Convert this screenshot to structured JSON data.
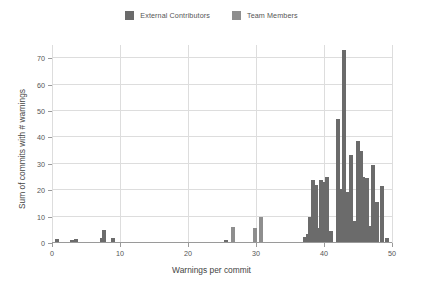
{
  "chart_data": {
    "type": "bar",
    "title": "",
    "xlabel": "Warnings per commit",
    "ylabel": "Sum of commits with # warnings",
    "xlim": [
      0,
      50
    ],
    "ylim": [
      0,
      75
    ],
    "yticks": [
      0,
      10,
      20,
      30,
      40,
      50,
      60,
      70
    ],
    "xticks": [
      0,
      10,
      20,
      30,
      40,
      50
    ],
    "grid": true,
    "legend_position": "top-center",
    "colors": {
      "external_contributors": "#6b6b6b",
      "team_members": "#8e8e8e",
      "gridline": "#dddddd",
      "axis": "#9a9a9a",
      "text": "#555555",
      "background": "#ffffff"
    },
    "series": [
      {
        "name": "External Contributors",
        "color": "#6b6b6b",
        "points": [
          {
            "x": 0.7,
            "y": 1.6
          },
          {
            "x": 3.0,
            "y": 1.1
          },
          {
            "x": 3.6,
            "y": 1.6
          },
          {
            "x": 7.3,
            "y": 2.0
          },
          {
            "x": 7.6,
            "y": 5.0
          },
          {
            "x": 8.9,
            "y": 2.0
          },
          {
            "x": 25.6,
            "y": 1.2
          },
          {
            "x": 37.2,
            "y": 2.3
          },
          {
            "x": 37.6,
            "y": 3.4
          },
          {
            "x": 38.0,
            "y": 10.0
          },
          {
            "x": 38.4,
            "y": 24.0
          },
          {
            "x": 38.8,
            "y": 22.0
          },
          {
            "x": 39.2,
            "y": 5.5
          },
          {
            "x": 39.6,
            "y": 24.0
          },
          {
            "x": 40.0,
            "y": 23.0
          },
          {
            "x": 40.4,
            "y": 25.0
          },
          {
            "x": 41.0,
            "y": 4.5
          },
          {
            "x": 42.0,
            "y": 47.0
          },
          {
            "x": 42.5,
            "y": 20.5
          },
          {
            "x": 43.0,
            "y": 73.0
          },
          {
            "x": 43.5,
            "y": 19.5
          },
          {
            "x": 44.0,
            "y": 33.5
          },
          {
            "x": 44.4,
            "y": 8.5
          },
          {
            "x": 45.0,
            "y": 38.5
          },
          {
            "x": 45.4,
            "y": 35.0
          },
          {
            "x": 45.8,
            "y": 25.0
          },
          {
            "x": 46.3,
            "y": 24.5
          },
          {
            "x": 46.8,
            "y": 6.5
          },
          {
            "x": 47.2,
            "y": 29.5
          },
          {
            "x": 47.8,
            "y": 15.5
          },
          {
            "x": 48.6,
            "y": 21.5
          },
          {
            "x": 49.2,
            "y": 2.0
          }
        ]
      },
      {
        "name": "Team Members",
        "color": "#8e8e8e",
        "points": [
          {
            "x": 26.6,
            "y": 6.2
          },
          {
            "x": 29.9,
            "y": 5.5
          },
          {
            "x": 30.8,
            "y": 10.0
          }
        ]
      }
    ],
    "bars": [
      {
        "x": 0.7,
        "y": 1.6,
        "series": 0
      },
      {
        "x": 3.0,
        "y": 1.1,
        "series": 0
      },
      {
        "x": 3.6,
        "y": 1.6,
        "series": 0
      },
      {
        "x": 7.3,
        "y": 2.0,
        "series": 0
      },
      {
        "x": 7.6,
        "y": 5.0,
        "series": 0
      },
      {
        "x": 8.9,
        "y": 2.0,
        "series": 0
      },
      {
        "x": 25.6,
        "y": 1.2,
        "series": 0
      },
      {
        "x": 26.6,
        "y": 6.2,
        "series": 1
      },
      {
        "x": 29.9,
        "y": 5.5,
        "series": 1
      },
      {
        "x": 30.8,
        "y": 10.0,
        "series": 1
      },
      {
        "x": 37.2,
        "y": 2.3,
        "series": 0
      },
      {
        "x": 37.6,
        "y": 3.4,
        "series": 0
      },
      {
        "x": 38.0,
        "y": 10.0,
        "series": 0
      },
      {
        "x": 38.4,
        "y": 24.0,
        "series": 0
      },
      {
        "x": 38.8,
        "y": 22.0,
        "series": 0
      },
      {
        "x": 39.2,
        "y": 5.5,
        "series": 0
      },
      {
        "x": 39.6,
        "y": 24.0,
        "series": 0
      },
      {
        "x": 40.0,
        "y": 23.0,
        "series": 0
      },
      {
        "x": 40.4,
        "y": 25.0,
        "series": 0
      },
      {
        "x": 41.0,
        "y": 4.5,
        "series": 0
      },
      {
        "x": 42.0,
        "y": 47.0,
        "series": 0
      },
      {
        "x": 42.5,
        "y": 20.5,
        "series": 0
      },
      {
        "x": 43.0,
        "y": 73.0,
        "series": 0
      },
      {
        "x": 43.5,
        "y": 19.5,
        "series": 0
      },
      {
        "x": 44.0,
        "y": 33.5,
        "series": 0
      },
      {
        "x": 44.4,
        "y": 8.5,
        "series": 0
      },
      {
        "x": 45.0,
        "y": 38.5,
        "series": 0
      },
      {
        "x": 45.4,
        "y": 35.0,
        "series": 0
      },
      {
        "x": 45.8,
        "y": 25.0,
        "series": 0
      },
      {
        "x": 46.3,
        "y": 24.5,
        "series": 0
      },
      {
        "x": 46.8,
        "y": 6.5,
        "series": 0
      },
      {
        "x": 47.2,
        "y": 29.5,
        "series": 0
      },
      {
        "x": 47.8,
        "y": 15.5,
        "series": 0
      },
      {
        "x": 48.6,
        "y": 21.5,
        "series": 0
      },
      {
        "x": 49.2,
        "y": 2.0,
        "series": 0
      }
    ]
  },
  "legend": {
    "entries": [
      {
        "label": "External Contributors",
        "color": "#6b6b6b"
      },
      {
        "label": "Team Members",
        "color": "#8e8e8e"
      }
    ]
  }
}
